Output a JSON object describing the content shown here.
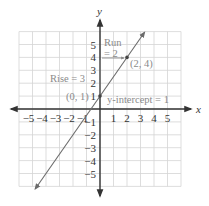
{
  "chart_data": {
    "type": "line",
    "title": "",
    "xlabel": "x",
    "ylabel": "y",
    "xlim": [
      -6,
      6
    ],
    "ylim": [
      -6,
      6
    ],
    "grid": true,
    "x_ticks": [
      -5,
      -4,
      -3,
      -2,
      -1,
      1,
      2,
      3,
      4,
      5
    ],
    "y_ticks": [
      -5,
      -4,
      -3,
      -2,
      -1,
      1,
      2,
      3,
      4,
      5
    ],
    "x_tick_labels": [
      "−5",
      "−4",
      "−3",
      "−2",
      "−1",
      "1",
      "2",
      "3",
      "4",
      "5"
    ],
    "y_tick_labels": [
      "−5",
      "−4",
      "−3",
      "−2",
      "−1",
      "1",
      "2",
      "3",
      "4",
      "5"
    ],
    "series": [
      {
        "name": "y = (3/2)x + 1",
        "slope": 1.5,
        "intercept": 1,
        "x": [
          -4.8,
          3.3
        ],
        "y": [
          -6.2,
          5.95
        ]
      }
    ],
    "points": [
      {
        "label": "(0, 1)",
        "x": 0,
        "y": 1
      },
      {
        "label": "(2, 4)",
        "x": 2,
        "y": 4
      }
    ],
    "annotations": [
      {
        "text": "Run",
        "x": 0.3,
        "y": 5.1
      },
      {
        "text": "= 2",
        "x": 0.3,
        "y": 4.2
      },
      {
        "text": "Rise = 3",
        "x": -3.8,
        "y": 2.75
      },
      {
        "text": "y-intercept = 1",
        "x": 0.45,
        "y": 0.6
      }
    ]
  },
  "labels": {
    "x_axis": "x",
    "y_axis": "y",
    "run_line1": "Run",
    "run_line2": "= 2",
    "rise": "Rise = 3",
    "point_a": "(0, 1)",
    "point_b": "(2, 4)",
    "y_intercept": "y-intercept = 1"
  },
  "colors": {
    "grid": "#d4d4d4",
    "axis": "#333333",
    "line": "#6b6b6b",
    "annotation": "#8a8a8a"
  }
}
